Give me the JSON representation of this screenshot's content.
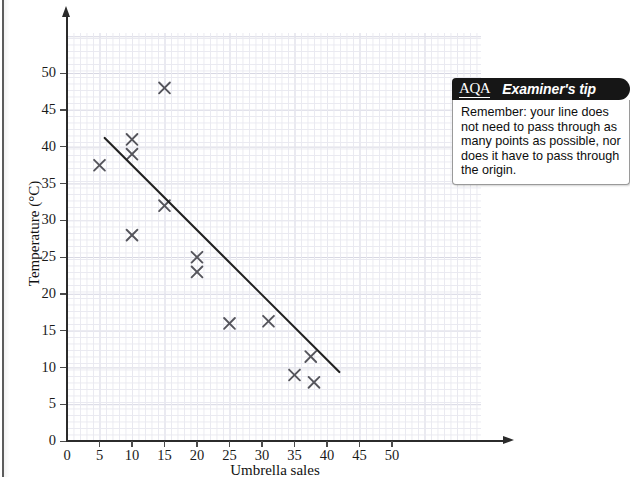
{
  "page": {
    "cropped_top_text": " ",
    "background_color": "#ffffff"
  },
  "chart_data": {
    "type": "scatter",
    "title": "",
    "xlabel": "Umbrella sales",
    "ylabel": "Temperature (°C)",
    "xlim": [
      0,
      55
    ],
    "ylim": [
      0,
      55
    ],
    "xticks": [
      0,
      5,
      10,
      15,
      20,
      25,
      30,
      35,
      40,
      45,
      50
    ],
    "yticks": [
      0,
      5,
      10,
      15,
      20,
      25,
      30,
      35,
      40,
      45,
      50
    ],
    "xtick_labels": [
      "0",
      "5",
      "10",
      "15",
      "20",
      "25",
      "30",
      "35",
      "40",
      "45",
      "50"
    ],
    "ytick_labels": [
      "0",
      "5",
      "10",
      "15",
      "20",
      "25",
      "30",
      "35",
      "40",
      "45",
      "50"
    ],
    "grid": true,
    "grid_minor_step": 1,
    "grid_major_step": 5,
    "legend": null,
    "marker": "x",
    "marker_color": "#55555c",
    "points": [
      {
        "x": 5,
        "y": 37.5
      },
      {
        "x": 10,
        "y": 41
      },
      {
        "x": 10,
        "y": 39
      },
      {
        "x": 10,
        "y": 28
      },
      {
        "x": 15,
        "y": 48
      },
      {
        "x": 15,
        "y": 32
      },
      {
        "x": 20,
        "y": 25
      },
      {
        "x": 20,
        "y": 23
      },
      {
        "x": 25,
        "y": 16
      },
      {
        "x": 31,
        "y": 16.3
      },
      {
        "x": 35,
        "y": 9
      },
      {
        "x": 37.5,
        "y": 11.5
      },
      {
        "x": 38,
        "y": 8
      }
    ],
    "trend_line": {
      "label": "line of best fit",
      "color": "#222222",
      "x_start": 5.8,
      "y_start": 41.2,
      "x_end": 41.9,
      "y_end": 9.4
    }
  },
  "examiner_tip": {
    "logo": "AQA",
    "title": "Examiner's tip",
    "body": "Remember: your line does not need to pass through as many points as possible, nor does it have to pass through the origin."
  }
}
